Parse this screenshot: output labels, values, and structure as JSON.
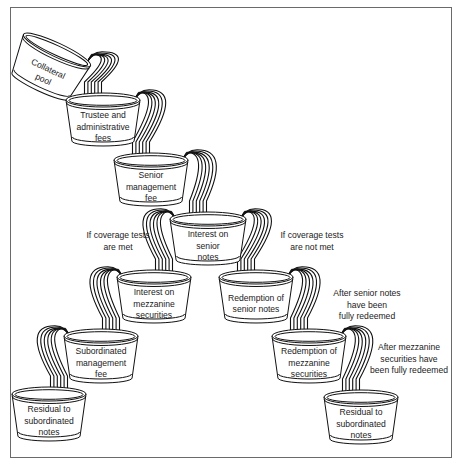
{
  "diagram": {
    "type": "cash-flow waterfall",
    "buckets": [
      {
        "id": "collateral-pool",
        "lines": [
          "Collateral",
          "pool"
        ],
        "cx": 57,
        "cy": 50,
        "w": 74,
        "h": 44,
        "tilt": 25
      },
      {
        "id": "trustee-fees",
        "lines": [
          "Trustee and",
          "administrative",
          "fees"
        ],
        "cx": 103,
        "cy": 100,
        "w": 74,
        "h": 45,
        "tilt": 0
      },
      {
        "id": "senior-mgmt-fee",
        "lines": [
          "Senior",
          "management",
          "fee"
        ],
        "cx": 151,
        "cy": 160,
        "w": 74,
        "h": 45,
        "tilt": 0
      },
      {
        "id": "interest-senior",
        "lines": [
          "Interest on",
          "senior",
          "notes"
        ],
        "cx": 208,
        "cy": 219,
        "w": 76,
        "h": 45,
        "tilt": 0
      },
      {
        "id": "interest-mezzanine",
        "lines": [
          "Interest on",
          "mezzanine",
          "securities"
        ],
        "cx": 154,
        "cy": 277,
        "w": 74,
        "h": 45,
        "tilt": 0
      },
      {
        "id": "sub-mgmt-fee",
        "lines": [
          "Subordinated",
          "management",
          "fee"
        ],
        "cx": 101,
        "cy": 336,
        "w": 74,
        "h": 46,
        "tilt": 0
      },
      {
        "id": "residual-left",
        "lines": [
          "Residual to",
          "subordinated",
          "notes"
        ],
        "cx": 49,
        "cy": 394,
        "w": 74,
        "h": 46,
        "tilt": 0
      },
      {
        "id": "redemption-senior",
        "lines": [
          "Redemption of",
          "senior notes"
        ],
        "cx": 256,
        "cy": 277,
        "w": 74,
        "h": 45,
        "tilt": 0
      },
      {
        "id": "redemption-mezzanine",
        "lines": [
          "Redemption of",
          "mezzanine",
          "securities"
        ],
        "cx": 309,
        "cy": 336,
        "w": 74,
        "h": 46,
        "tilt": 0
      },
      {
        "id": "residual-right",
        "lines": [
          "Residual to",
          "subordinated",
          "notes"
        ],
        "cx": 361,
        "cy": 397,
        "w": 74,
        "h": 46,
        "tilt": 0
      }
    ],
    "annotations": [
      {
        "id": "coverage-met",
        "lines": [
          "If coverage tests",
          "are met"
        ],
        "x": 118,
        "y": 238
      },
      {
        "id": "coverage-not-met",
        "lines": [
          "If coverage tests",
          "are not met"
        ],
        "x": 312,
        "y": 238
      },
      {
        "id": "after-senior",
        "lines": [
          "After senior notes",
          "have been",
          "fully redeemed"
        ],
        "x": 367,
        "y": 296
      },
      {
        "id": "after-mezzanine",
        "lines": [
          "After mezzanine",
          "securities have",
          "been fully redeemed"
        ],
        "x": 409,
        "y": 350
      }
    ],
    "flows": [
      {
        "from": "collateral-pool",
        "to": "trustee-fees"
      },
      {
        "from": "trustee-fees",
        "to": "senior-mgmt-fee"
      },
      {
        "from": "senior-mgmt-fee",
        "to": "interest-senior"
      },
      {
        "from": "interest-senior",
        "to": "interest-mezzanine",
        "condition": "If coverage tests are met"
      },
      {
        "from": "interest-mezzanine",
        "to": "sub-mgmt-fee"
      },
      {
        "from": "sub-mgmt-fee",
        "to": "residual-left"
      },
      {
        "from": "interest-senior",
        "to": "redemption-senior",
        "condition": "If coverage tests are not met"
      },
      {
        "from": "redemption-senior",
        "to": "redemption-mezzanine",
        "condition": "After senior notes have been fully redeemed"
      },
      {
        "from": "redemption-mezzanine",
        "to": "residual-right",
        "condition": "After mezzanine securities have been fully redeemed"
      }
    ]
  }
}
